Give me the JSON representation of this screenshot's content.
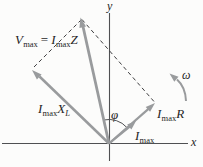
{
  "colors": {
    "background": "#fcfcfb",
    "vector": "#999b9d",
    "axis": "#4f5052",
    "dashed": "#3f3f41",
    "text": "#1f1f1f"
  },
  "labels": {
    "y_axis": "y",
    "x_axis": "x",
    "v_max": {
      "v": "V",
      "v_sub": "max",
      "eq": "=",
      "i": "I",
      "i_sub": "max",
      "z": "Z"
    },
    "i_xl": {
      "i": "I",
      "i_sub": "max",
      "x": "X",
      "x_sub": "L"
    },
    "i_r": {
      "i": "I",
      "i_sub": "max",
      "r": "R"
    },
    "i_max": {
      "i": "I",
      "i_sub": "max"
    },
    "phi": "φ",
    "omega": "ω"
  }
}
